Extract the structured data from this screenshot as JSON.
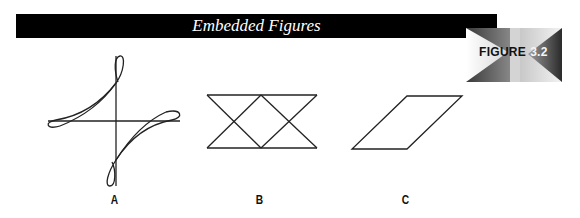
{
  "header": {
    "title": "Embedded Figures",
    "bar_color": "#000000"
  },
  "badge": {
    "word": "FIGURE",
    "number": "3.2"
  },
  "figures": [
    {
      "label": "A",
      "shape": "crossed-lines-with-loops"
    },
    {
      "label": "B",
      "shape": "double-hourglass-rectangle"
    },
    {
      "label": "C",
      "shape": "parallelogram"
    }
  ]
}
